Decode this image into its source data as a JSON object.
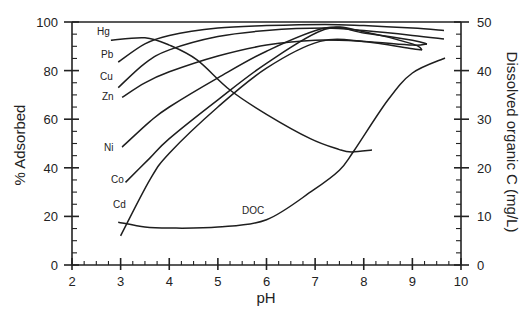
{
  "chart_data": {
    "type": "line",
    "title": "",
    "xlabel": "pH",
    "ylabel": "% Adsorbed",
    "y2label": "Dissolved organic C (mg/L)",
    "xlim": [
      2,
      10
    ],
    "ylim": [
      0,
      100
    ],
    "y2lim": [
      0,
      50
    ],
    "xticks": [
      "2",
      "3",
      "4",
      "5",
      "6",
      "7",
      "8",
      "9",
      "10"
    ],
    "yticks": [
      "0",
      "20",
      "40",
      "60",
      "80",
      "100"
    ],
    "y2ticks": [
      "0",
      "10",
      "20",
      "30",
      "40",
      "50"
    ],
    "grid": false,
    "legend": "inline labels",
    "series": [
      {
        "name": "Hg",
        "axis": "left",
        "x": [
          2.8,
          3.5,
          4.0,
          4.57,
          5.25,
          6.0,
          6.9,
          7.5,
          7.75,
          8.17
        ],
        "y": [
          92.5,
          93.5,
          90.5,
          84.4,
          72,
          62,
          52,
          47.5,
          46.5,
          47.3
        ]
      },
      {
        "name": "Pb",
        "axis": "left",
        "x": [
          2.95,
          3.5,
          4.0,
          5.0,
          6.0,
          7.2,
          8.0,
          9.0,
          9.65
        ],
        "y": [
          83.5,
          91,
          94.5,
          97.5,
          98.5,
          99,
          98.5,
          97.5,
          96.5
        ]
      },
      {
        "name": "Cu",
        "axis": "left",
        "x": [
          2.95,
          3.5,
          4.0,
          5.0,
          6.0,
          7.2,
          8.0,
          9.0,
          9.65
        ],
        "y": [
          73,
          83,
          88.5,
          94,
          96.5,
          97.5,
          96.5,
          94.5,
          93
        ]
      },
      {
        "name": "Zn",
        "axis": "left",
        "x": [
          3.03,
          3.5,
          4.0,
          5.0,
          6.0,
          7.0,
          8.0,
          9.0,
          9.3
        ],
        "y": [
          69,
          75,
          79.5,
          86,
          90.5,
          92.5,
          92,
          90.5,
          91
        ]
      },
      {
        "name": "Ni",
        "axis": "left",
        "x": [
          3.03,
          3.6,
          4.0,
          5.0,
          6.0,
          7.2,
          8.0,
          9.0,
          9.2
        ],
        "y": [
          48.5,
          59,
          65,
          77,
          88,
          97.5,
          96,
          91,
          88.5
        ]
      },
      {
        "name": "Co",
        "axis": "left",
        "x": [
          3.1,
          3.6,
          4.0,
          5.0,
          6.0,
          7.2,
          8.0,
          9.0,
          9.3
        ],
        "y": [
          34,
          44,
          52,
          68,
          83,
          97,
          95.5,
          92.5,
          91
        ]
      },
      {
        "name": "Cd",
        "axis": "left",
        "x": [
          3.0,
          3.6,
          4.0,
          5.0,
          6.0,
          7.1,
          8.0,
          9.0,
          9.2
        ],
        "y": [
          12,
          35,
          46,
          65,
          81,
          92,
          92,
          89,
          88.5
        ]
      },
      {
        "name": "DOC",
        "axis": "right",
        "x": [
          2.95,
          3.5,
          4.0,
          5.0,
          6.0,
          6.96,
          7.5,
          7.8,
          8.5,
          9.0,
          9.67
        ],
        "y": [
          8.8,
          7.8,
          7.6,
          7.8,
          9.3,
          15.4,
          19.5,
          23.5,
          34,
          39.5,
          42.6
        ]
      }
    ],
    "annotations": [
      "Hg",
      "Pb",
      "Cu",
      "Zn",
      "Ni",
      "Co",
      "Cd",
      "DOC"
    ]
  }
}
